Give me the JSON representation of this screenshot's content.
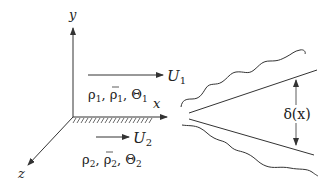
{
  "diagram": {
    "type": "mixing-layer-schematic",
    "axes": {
      "y_label": "y",
      "x_label": "x",
      "z_label": "z"
    },
    "upper_stream": {
      "velocity_label": "U",
      "velocity_sub": "1",
      "props": {
        "rho": "ρ",
        "rho_sub": "1",
        "rhobar": "ρ",
        "rhobar_sub": "1",
        "theta": "Θ",
        "theta_sub": "1",
        "sep": ", "
      }
    },
    "lower_stream": {
      "velocity_label": "U",
      "velocity_sub": "2",
      "props": {
        "rho": "ρ",
        "rho_sub": "2",
        "rhobar": "ρ",
        "rhobar_sub": "2",
        "theta": "Θ",
        "theta_sub": "2",
        "sep": ", "
      }
    },
    "thickness_label": "δ(x)",
    "colors": {
      "line": "#333333",
      "text": "#222222",
      "background": "#ffffff"
    }
  }
}
